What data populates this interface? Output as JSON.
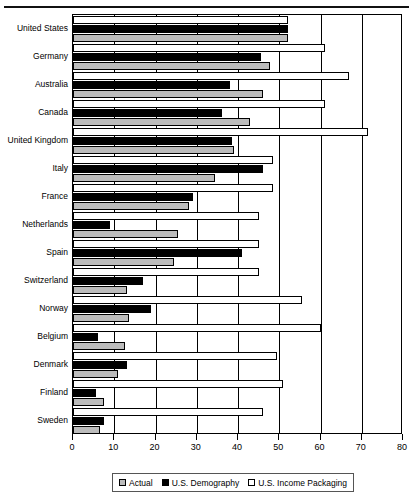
{
  "chart_data": {
    "type": "bar",
    "orientation": "horizontal",
    "title": "",
    "xlabel": "",
    "ylabel": "",
    "xlim": [
      0,
      80
    ],
    "xticks": [
      0,
      10,
      20,
      30,
      40,
      50,
      60,
      70,
      80
    ],
    "grid": true,
    "legend_position": "bottom",
    "categories": [
      "United States",
      "Germany",
      "Australia",
      "Canada",
      "United Kingdom",
      "Italy",
      "France",
      "Netherlands",
      "Spain",
      "Switzerland",
      "Norway",
      "Belgium",
      "Denmark",
      "Finland",
      "Sweden"
    ],
    "series": [
      {
        "name": "U.S. Income Packaging",
        "color": "#ffffff",
        "values": [
          52,
          61,
          67,
          61,
          71.5,
          48.5,
          48.5,
          45,
          45,
          45,
          55.5,
          60,
          49.5,
          51,
          46
        ]
      },
      {
        "name": "U.S. Demography",
        "color": "#000000",
        "values": [
          52,
          45.5,
          38,
          36,
          38.5,
          46,
          29,
          9,
          41,
          17,
          19,
          6,
          13,
          5.5,
          7.5
        ]
      },
      {
        "name": "Actual",
        "color": "#bcbcbc",
        "values": [
          52,
          47.7,
          46,
          43,
          39,
          34.5,
          28,
          25.5,
          24.5,
          13,
          13.5,
          12.5,
          11,
          7.5,
          6.5
        ]
      }
    ]
  },
  "legend": {
    "items": [
      {
        "label": "Actual",
        "swatch": "gray"
      },
      {
        "label": "U.S. Demography",
        "swatch": "black"
      },
      {
        "label": "U.S. Income Packaging",
        "swatch": "white"
      }
    ]
  }
}
